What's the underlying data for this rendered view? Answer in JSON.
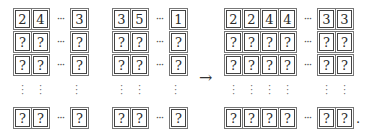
{
  "diagram": {
    "left_grid": {
      "rows": [
        {
          "cells": [
            "2",
            "4",
            "3"
          ]
        },
        {
          "cells": [
            "?",
            "?",
            "?"
          ]
        },
        {
          "cells": [
            "?",
            "?",
            "?"
          ]
        },
        {
          "cells": [
            "?",
            "?",
            "?"
          ]
        }
      ],
      "ellipsis": "···",
      "vertical_ellipsis": "⋮"
    },
    "middle_grid": {
      "rows": [
        {
          "cells": [
            "3",
            "5",
            "1"
          ]
        },
        {
          "cells": [
            "?",
            "?",
            "?"
          ]
        },
        {
          "cells": [
            "?",
            "?",
            "?"
          ]
        },
        {
          "cells": [
            "?",
            "?",
            "?"
          ]
        }
      ],
      "ellipsis": "···",
      "vertical_ellipsis": "⋮"
    },
    "arrow": "→",
    "right_grid": {
      "rows": [
        {
          "cells": [
            "2",
            "2",
            "4",
            "4",
            "3",
            "3"
          ]
        },
        {
          "cells": [
            "?",
            "?",
            "?",
            "?",
            "?",
            "?"
          ]
        },
        {
          "cells": [
            "?",
            "?",
            "?",
            "?",
            "?",
            "?"
          ]
        },
        {
          "cells": [
            "?",
            "?",
            "?",
            "?",
            "?",
            "?"
          ]
        }
      ],
      "ellipsis": "···",
      "vertical_ellipsis": "⋮",
      "trailing_punctuation": "."
    }
  }
}
